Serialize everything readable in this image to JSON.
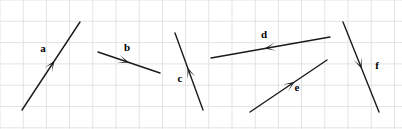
{
  "figure": {
    "width": 402,
    "height": 129,
    "background_color": "#ffffff",
    "grid": {
      "visible": true,
      "color": "#e3e3e3",
      "cell_width": 23.2,
      "cell_height": 21.3,
      "line_width": 1,
      "columns": 18,
      "rows": 7
    },
    "vector_color": "#1a1a1a",
    "vector_line_width": 1.4
  },
  "chart_data": {
    "type": "diagram",
    "title": "",
    "xlabel": "",
    "ylabel": "",
    "grid": true,
    "legend": "none",
    "vectors": [
      {
        "label": "a",
        "x1": 22,
        "y1": 110,
        "x2": 80,
        "y2": 22,
        "arrow_t": 0.56,
        "direction": "up-right",
        "label_x": 43,
        "label_y": 52
      },
      {
        "label": "b",
        "x1": 98,
        "y1": 52,
        "x2": 160,
        "y2": 73,
        "arrow_t": 0.5,
        "direction": "down-right",
        "label_x": 127,
        "label_y": 51
      },
      {
        "label": "c",
        "x1": 203,
        "y1": 110,
        "x2": 175,
        "y2": 33,
        "arrow_t": 0.55,
        "direction": "up-left",
        "label_x": 180,
        "label_y": 82
      },
      {
        "label": "d",
        "x1": 330,
        "y1": 37,
        "x2": 211,
        "y2": 58,
        "arrow_t": 0.55,
        "direction": "left",
        "label_x": 264,
        "label_y": 38
      },
      {
        "label": "e",
        "x1": 250,
        "y1": 112,
        "x2": 327,
        "y2": 60,
        "arrow_t": 0.58,
        "direction": "up-right",
        "label_x": 297,
        "label_y": 91
      },
      {
        "label": "f",
        "x1": 343,
        "y1": 22,
        "x2": 379,
        "y2": 112,
        "arrow_t": 0.52,
        "direction": "down-right",
        "label_x": 377,
        "label_y": 69
      }
    ]
  }
}
